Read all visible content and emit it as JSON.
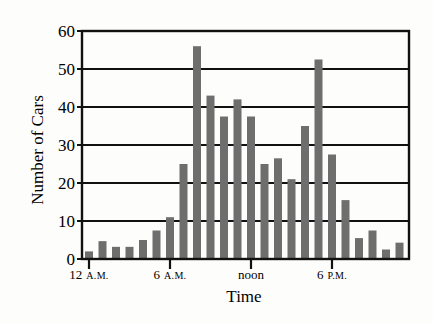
{
  "chart_data": {
    "type": "bar",
    "title": "",
    "xlabel": "Time",
    "ylabel": "Number of Cars",
    "ylim": [
      0,
      60
    ],
    "yticks": [
      0,
      10,
      20,
      30,
      40,
      50,
      60
    ],
    "grid": true,
    "legend": null,
    "x_tick_labels": [
      {
        "hour": 0,
        "label": "12",
        "suffix": "A.M."
      },
      {
        "hour": 6,
        "label": "6",
        "suffix": "A.M."
      },
      {
        "hour": 12,
        "label": "noon",
        "suffix": ""
      },
      {
        "hour": 18,
        "label": "6",
        "suffix": "P.M."
      }
    ],
    "categories": [
      "12 A.M.",
      "1 A.M.",
      "2 A.M.",
      "3 A.M.",
      "4 A.M.",
      "5 A.M.",
      "6 A.M.",
      "7 A.M.",
      "8 A.M.",
      "9 A.M.",
      "10 A.M.",
      "11 A.M.",
      "noon",
      "1 P.M.",
      "2 P.M.",
      "3 P.M.",
      "4 P.M.",
      "5 P.M.",
      "6 P.M.",
      "7 P.M.",
      "8 P.M.",
      "9 P.M.",
      "10 P.M.",
      "11 P.M."
    ],
    "values": [
      2,
      4.7,
      3.2,
      3.2,
      5,
      7.5,
      11,
      25,
      56,
      43,
      37.5,
      42,
      37.5,
      25,
      26.5,
      21,
      35,
      52.5,
      27.5,
      15.5,
      5.5,
      7.5,
      2.5,
      4.3
    ],
    "bar_color": "#6e6e6e"
  }
}
